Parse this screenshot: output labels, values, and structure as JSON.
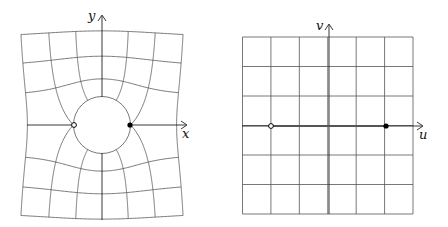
{
  "figure": {
    "left_panel": {
      "axis_labels": {
        "horizontal": "x",
        "vertical": "y"
      },
      "circle_radius_units": 1,
      "points": [
        {
          "name": "open-point",
          "z": [
            -1,
            0
          ],
          "style": "open"
        },
        {
          "name": "filled-point",
          "z": [
            1,
            0
          ],
          "style": "filled"
        }
      ]
    },
    "right_panel": {
      "axis_labels": {
        "horizontal": "u",
        "vertical": "v"
      },
      "grid_range": {
        "u": [
          -3,
          3
        ],
        "v": [
          -3,
          3
        ],
        "step": 1
      },
      "slit": {
        "from": [
          -2,
          0
        ],
        "to": [
          2,
          0
        ]
      },
      "points": [
        {
          "name": "open-point",
          "w": [
            -2,
            0
          ],
          "style": "open"
        },
        {
          "name": "filled-point",
          "w": [
            2,
            0
          ],
          "style": "filled"
        }
      ]
    }
  },
  "colors": {
    "grid": "#555555",
    "axis": "#222222",
    "point": "#000000"
  }
}
